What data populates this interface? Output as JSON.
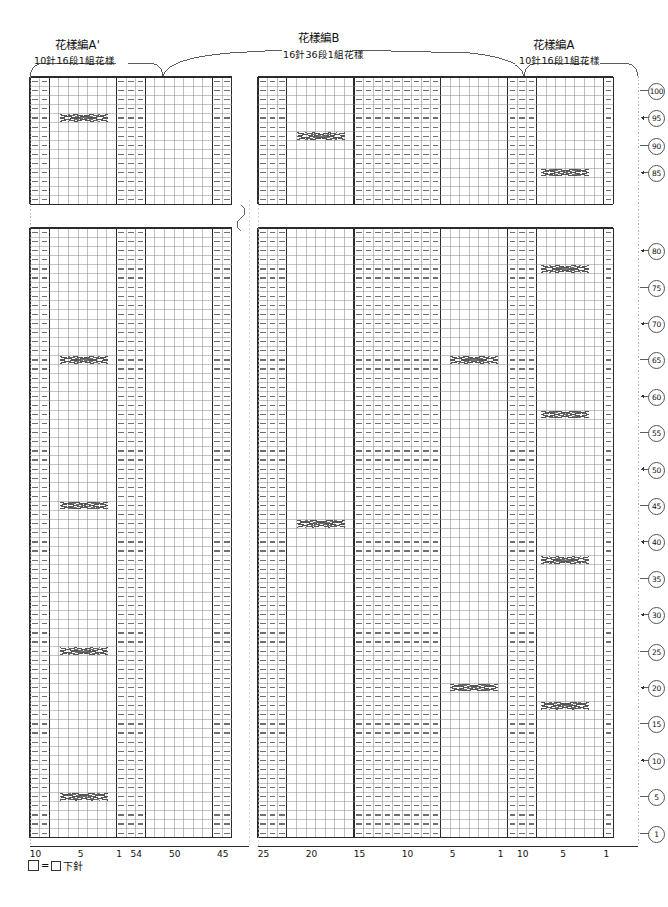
{
  "document": {
    "kind": "knitting-stitch-chart",
    "legend": {
      "symbol_empty": "□",
      "equals": "=",
      "symbol_knit": "□",
      "text": "下針"
    }
  },
  "sections": [
    {
      "id": "pattern-a-prime",
      "title": "花樣編A'",
      "subtitle": "10針16段1組花樣"
    },
    {
      "id": "pattern-b",
      "title": "花樣編B",
      "subtitle": "16針36段1組花樣"
    },
    {
      "id": "pattern-a",
      "title": "花樣編A",
      "subtitle": "10針16段1組花樣"
    }
  ],
  "axis": {
    "bottom_groups": [
      {
        "id": "left-a-prime",
        "labels": [
          "10",
          "5",
          "1"
        ]
      },
      {
        "id": "left-b",
        "labels": [
          "54",
          "50",
          "45"
        ]
      },
      {
        "id": "right-b",
        "labels": [
          "25",
          "20",
          "15",
          "10",
          "5",
          "1"
        ]
      },
      {
        "id": "right-a",
        "labels": [
          "10",
          "5",
          "1"
        ]
      }
    ],
    "row_numbers_top": [
      "100",
      "95",
      "90",
      "85"
    ],
    "row_numbers_bottom": [
      "80",
      "75",
      "70",
      "65",
      "60",
      "55",
      "50",
      "45",
      "40",
      "35",
      "30",
      "25",
      "20",
      "15",
      "10",
      "5",
      "1"
    ]
  },
  "chart_data": {
    "type": "table",
    "xlabel": "stitch number",
    "ylabel": "row number",
    "grid": true,
    "cell_width": 9.6,
    "cell_height": 9.1,
    "panels": [
      {
        "id": "top-left",
        "x": 30,
        "y": 77,
        "cols": 21,
        "rows": 14
      },
      {
        "id": "top-right",
        "x": 258,
        "y": 77,
        "cols": 37,
        "rows": 14
      },
      {
        "id": "bottom-left",
        "x": 30,
        "y": 228,
        "cols": 21,
        "rows": 67
      },
      {
        "id": "bottom-right",
        "x": 258,
        "y": 228,
        "cols": 37,
        "rows": 67
      }
    ],
    "purl_columns_left": [
      0,
      1,
      9,
      10,
      11,
      19,
      20
    ],
    "purl_columns_right": [
      0,
      1,
      2,
      10,
      11,
      12,
      13,
      14,
      15,
      16,
      17,
      18,
      26,
      27,
      28,
      36
    ],
    "cable_rows_interval": 16,
    "series": [
      {
        "name": "knit",
        "symbol": "blank",
        "count": 0
      },
      {
        "name": "purl",
        "symbol": "dash",
        "count": 0
      },
      {
        "name": "cable-cross",
        "symbol": "braid-x",
        "count": 0
      }
    ]
  },
  "colors": {
    "grid_line": "#8a8a8a",
    "grid_major": "#2b2b2b",
    "purl_mark": "#6f6f6f",
    "cable_mark": "#555555",
    "text": "#111111",
    "background": "#ffffff"
  }
}
